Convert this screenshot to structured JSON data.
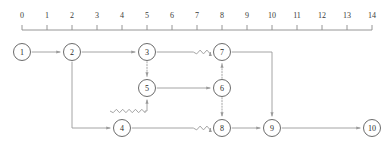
{
  "diagram": {
    "kind": "activity-network-diagram",
    "title": "",
    "colors": {
      "background": "#ffffff",
      "stroke": "#9a9a9a",
      "node_stroke": "#5a5a5a",
      "node_fill": "#ffffff",
      "text": "#2a2a2a",
      "axis": "#8a8a8a"
    },
    "axis": {
      "name": "time-axis",
      "orientation": "horizontal",
      "min": 0,
      "max": 14,
      "step": 1,
      "x_origin_px": 22,
      "px_per_unit": 25,
      "baseline_y_px": 30,
      "label_y_px": 18,
      "tick_length_px": 5,
      "ticks": [
        {
          "value": 0,
          "label": "0"
        },
        {
          "value": 1,
          "label": "1"
        },
        {
          "value": 2,
          "label": "2"
        },
        {
          "value": 3,
          "label": "3"
        },
        {
          "value": 4,
          "label": "4"
        },
        {
          "value": 5,
          "label": "5"
        },
        {
          "value": 6,
          "label": "6"
        },
        {
          "value": 7,
          "label": "7"
        },
        {
          "value": 8,
          "label": "8"
        },
        {
          "value": 9,
          "label": "9"
        },
        {
          "value": 10,
          "label": "10"
        },
        {
          "value": 11,
          "label": "11"
        },
        {
          "value": 12,
          "label": "12"
        },
        {
          "value": 13,
          "label": "13"
        },
        {
          "value": 14,
          "label": "14"
        }
      ]
    },
    "node_radius_px": 8.5,
    "nodes": [
      {
        "id": "1",
        "label": "1",
        "x": 22,
        "y": 52,
        "time": 0
      },
      {
        "id": "2",
        "label": "2",
        "x": 72,
        "y": 52,
        "time": 2
      },
      {
        "id": "3",
        "label": "3",
        "x": 147,
        "y": 52,
        "time": 5
      },
      {
        "id": "4",
        "label": "4",
        "x": 122,
        "y": 128,
        "time": 4
      },
      {
        "id": "5",
        "label": "5",
        "x": 147,
        "y": 88,
        "time": 5
      },
      {
        "id": "6",
        "label": "6",
        "x": 222,
        "y": 88,
        "time": 8
      },
      {
        "id": "7",
        "label": "7",
        "x": 222,
        "y": 52,
        "time": 8
      },
      {
        "id": "8",
        "label": "8",
        "x": 222,
        "y": 128,
        "time": 8
      },
      {
        "id": "9",
        "label": "9",
        "x": 272,
        "y": 128,
        "time": 10
      },
      {
        "id": "10",
        "label": "10",
        "x": 372,
        "y": 128,
        "time": 14
      }
    ],
    "edges": [
      {
        "id": "e1-2",
        "from": "1",
        "to": "2",
        "style": "solid",
        "arrow": true,
        "shape": "straight"
      },
      {
        "id": "e2-3",
        "from": "2",
        "to": "3",
        "style": "solid",
        "arrow": true,
        "shape": "straight"
      },
      {
        "id": "e3-7",
        "from": "3",
        "to": "7",
        "style": "solid",
        "arrow": true,
        "shape": "wavy-tail"
      },
      {
        "id": "e3-5",
        "from": "3",
        "to": "5",
        "style": "dotted",
        "arrow": true,
        "shape": "straight"
      },
      {
        "id": "e2-4",
        "from": "2",
        "to": "4",
        "style": "solid",
        "arrow": true,
        "shape": "orthogonal-down-right"
      },
      {
        "id": "e4-5",
        "from": "4",
        "to": "5",
        "style": "solid",
        "arrow": true,
        "shape": "wavy-right-up"
      },
      {
        "id": "e5-6",
        "from": "5",
        "to": "6",
        "style": "solid",
        "arrow": true,
        "shape": "straight"
      },
      {
        "id": "e6-7",
        "from": "6",
        "to": "7",
        "style": "dotted",
        "arrow": true,
        "shape": "straight"
      },
      {
        "id": "e6-8",
        "from": "6",
        "to": "8",
        "style": "dotted",
        "arrow": true,
        "shape": "straight"
      },
      {
        "id": "e4-8",
        "from": "4",
        "to": "8",
        "style": "solid",
        "arrow": true,
        "shape": "wavy-tail"
      },
      {
        "id": "e7-9",
        "from": "7",
        "to": "9",
        "style": "solid",
        "arrow": true,
        "shape": "orthogonal-right-down"
      },
      {
        "id": "e8-9",
        "from": "8",
        "to": "9",
        "style": "solid",
        "arrow": true,
        "shape": "straight"
      },
      {
        "id": "e9-10",
        "from": "9",
        "to": "10",
        "style": "solid",
        "arrow": true,
        "shape": "straight"
      }
    ]
  }
}
